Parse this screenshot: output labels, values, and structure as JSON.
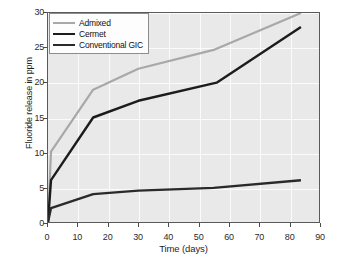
{
  "chart_data": {
    "type": "line",
    "title": "",
    "xlabel": "Time (days)",
    "ylabel": "Fluoride release in ppm",
    "xlim": [
      0,
      90
    ],
    "ylim": [
      0,
      30
    ],
    "xticks": [
      0,
      10,
      20,
      30,
      40,
      50,
      60,
      70,
      80,
      90
    ],
    "yticks": [
      0,
      5,
      10,
      15,
      20,
      25,
      30
    ],
    "grid": true,
    "legend_position": "upper left",
    "series": [
      {
        "name": "Admixed",
        "color": "#a8a8a8",
        "width": 2.2,
        "x": [
          0,
          1,
          15,
          30,
          55,
          84
        ],
        "y": [
          0,
          10.1,
          19.0,
          22.0,
          24.7,
          30.0
        ]
      },
      {
        "name": "Cermet",
        "color": "#1c1c1c",
        "width": 2.4,
        "x": [
          0,
          1,
          15,
          30,
          56,
          84
        ],
        "y": [
          0,
          6.0,
          15.0,
          17.4,
          20.0,
          28.0
        ]
      },
      {
        "name": "Conventional GIC",
        "color": "#2a2a2a",
        "width": 2.4,
        "x": [
          0,
          1,
          15,
          30,
          55,
          84
        ],
        "y": [
          0,
          2.0,
          4.0,
          4.5,
          4.9,
          6.0
        ]
      }
    ]
  },
  "colors": {
    "plot_background": "#e9e9e9",
    "grid": "#fbfbfb",
    "frame": "#5a5a5a",
    "figure_background": "#ffffff",
    "tick_text": "#2b2b2b"
  }
}
